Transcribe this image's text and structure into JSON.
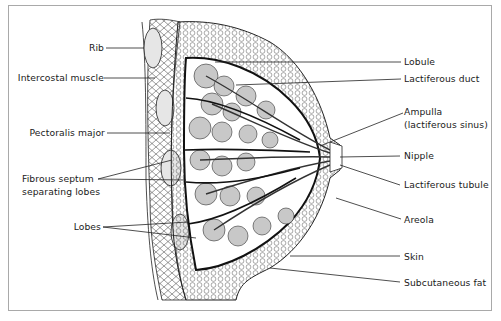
{
  "diagram": {
    "colors": {
      "line": "#1a1a1a",
      "lobule_fill": "#c8c8c8",
      "frame": "#a9a9a9",
      "background": "#ffffff"
    },
    "left_labels": [
      {
        "id": "rib",
        "text": "Rib"
      },
      {
        "id": "intercostal",
        "text": "Intercostal muscle"
      },
      {
        "id": "pectoralis",
        "text": "Pectoralis major"
      },
      {
        "id": "septum1",
        "text": "Fibrous septum"
      },
      {
        "id": "septum2",
        "text": "separating lobes"
      },
      {
        "id": "lobes",
        "text": "Lobes"
      }
    ],
    "right_labels": [
      {
        "id": "lobule",
        "text": "Lobule"
      },
      {
        "id": "lact_duct",
        "text": "Lactiferous duct"
      },
      {
        "id": "ampulla1",
        "text": "Ampulla"
      },
      {
        "id": "ampulla2",
        "text": "(lactiferous sinus)"
      },
      {
        "id": "nipple",
        "text": "Nipple"
      },
      {
        "id": "lact_tubule",
        "text": "Lactiferous tubule"
      },
      {
        "id": "areola",
        "text": "Areola"
      },
      {
        "id": "skin",
        "text": "Skin"
      },
      {
        "id": "subq",
        "text": "Subcutaneous fat"
      }
    ]
  }
}
